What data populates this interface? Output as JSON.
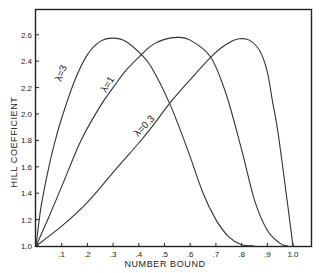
{
  "chart_data": {
    "type": "line",
    "title": "",
    "xlabel": "NUMBER BOUND",
    "ylabel": "HILL COEFFICIENT",
    "xlim": [
      0,
      1.07
    ],
    "ylim": [
      1.0,
      2.82
    ],
    "grid": false,
    "legend": "inline labels on curves",
    "x_ticks": [
      0.1,
      0.2,
      0.3,
      0.4,
      0.5,
      0.6,
      0.7,
      0.8,
      0.9,
      1.0
    ],
    "x_tick_labels": [
      ".1",
      ".2",
      ".3",
      ".4",
      ".5",
      ".6",
      ".7",
      ".8",
      ".9",
      "1.0"
    ],
    "y_ticks": [
      1.0,
      1.2,
      1.4,
      1.6,
      1.8,
      2.0,
      2.2,
      2.4,
      2.6
    ],
    "y_tick_labels": [
      "1.0",
      "1.2",
      "1.4",
      "1.6",
      "1.8",
      "2.0",
      "2.2",
      "2.4",
      "2.6"
    ],
    "series": [
      {
        "name": "λ=3",
        "label": "λ=3",
        "x": [
          0.0,
          0.02,
          0.05,
          0.075,
          0.1,
          0.15,
          0.2,
          0.25,
          0.3,
          0.35,
          0.41,
          0.45,
          0.52,
          0.59,
          0.65,
          0.7,
          0.75,
          0.8,
          0.85
        ],
        "y": [
          1.0,
          1.3,
          1.6,
          1.8,
          1.97,
          2.25,
          2.45,
          2.55,
          2.575,
          2.55,
          2.45,
          2.35,
          2.08,
          1.73,
          1.4,
          1.2,
          1.07,
          1.01,
          1.0
        ],
        "peak": {
          "x": 0.3,
          "y": 2.575
        }
      },
      {
        "name": "λ=1",
        "label": "λ=1",
        "x": [
          0.0,
          0.05,
          0.1,
          0.175,
          0.25,
          0.3,
          0.35,
          0.41,
          0.45,
          0.5,
          0.55,
          0.6,
          0.68,
          0.74,
          0.8,
          0.85,
          0.9,
          0.95,
          0.98
        ],
        "y": [
          1.0,
          1.22,
          1.45,
          1.8,
          2.06,
          2.2,
          2.33,
          2.45,
          2.52,
          2.565,
          2.58,
          2.56,
          2.43,
          2.15,
          1.73,
          1.35,
          1.12,
          1.02,
          1.0
        ],
        "peak": {
          "x": 0.55,
          "y": 2.58
        }
      },
      {
        "name": "λ=0.3",
        "label": "λ=0.3",
        "x": [
          0.0,
          0.1,
          0.2,
          0.31,
          0.4,
          0.45,
          0.52,
          0.6,
          0.68,
          0.72,
          0.76,
          0.79,
          0.83,
          0.87,
          0.9,
          0.92,
          0.94,
          0.96,
          0.98,
          1.0
        ],
        "y": [
          1.0,
          1.15,
          1.33,
          1.58,
          1.78,
          1.9,
          2.08,
          2.26,
          2.43,
          2.5,
          2.55,
          2.57,
          2.56,
          2.48,
          2.32,
          2.1,
          1.88,
          1.6,
          1.3,
          1.0
        ],
        "peak": {
          "x": 0.79,
          "y": 2.57
        }
      }
    ],
    "intersections": [
      {
        "series": [
          "λ=3",
          "λ=1"
        ],
        "x": 0.41,
        "y": 2.45
      },
      {
        "series": [
          "λ=1",
          "λ=0.3"
        ],
        "x": 0.68,
        "y": 2.43
      },
      {
        "series": [
          "λ=3",
          "λ=0.3"
        ],
        "x": 0.52,
        "y": 2.08
      }
    ]
  },
  "labels": {
    "xlabel": "NUMBER BOUND",
    "ylabel": "HILL COEFFICIENT",
    "curve_lambda3": "λ=3",
    "curve_lambda1": "λ=1",
    "curve_lambda03": "λ=0.3"
  },
  "colors": {
    "line": "#333333",
    "axis": "#222222",
    "background": "#ffffff"
  }
}
